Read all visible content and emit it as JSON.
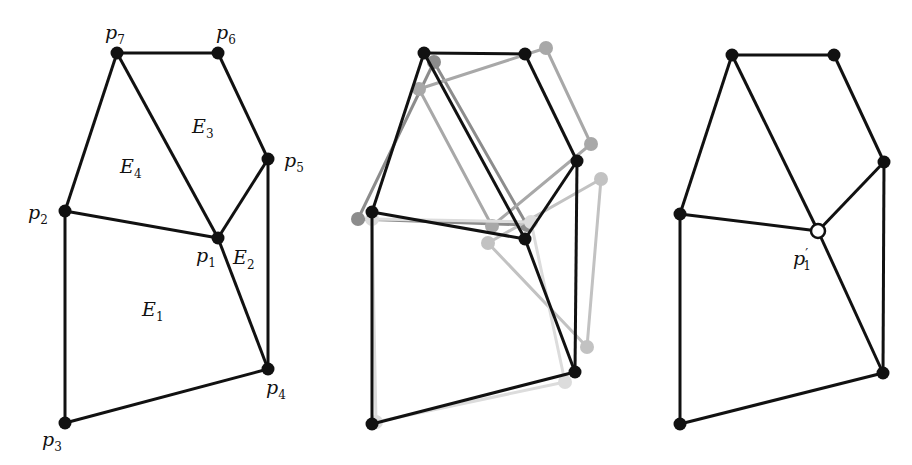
{
  "figure": {
    "panels": [
      {
        "id": "left",
        "title": "",
        "vertices": [
          {
            "name": "p1",
            "x": 218,
            "y": 238,
            "lx": 196,
            "ly": 262,
            "label": "p",
            "sub": "1"
          },
          {
            "name": "p2",
            "x": 65,
            "y": 211,
            "lx": 28,
            "ly": 219,
            "label": "p",
            "sub": "2"
          },
          {
            "name": "p3",
            "x": 65,
            "y": 423,
            "lx": 42,
            "ly": 446,
            "label": "p",
            "sub": "3"
          },
          {
            "name": "p4",
            "x": 268,
            "y": 369,
            "lx": 266,
            "ly": 394,
            "label": "p",
            "sub": "4"
          },
          {
            "name": "p5",
            "x": 268,
            "y": 159,
            "lx": 284,
            "ly": 167,
            "label": "p",
            "sub": "5"
          },
          {
            "name": "p6",
            "x": 218,
            "y": 53,
            "lx": 216,
            "ly": 39,
            "label": "p",
            "sub": "6"
          },
          {
            "name": "p7",
            "x": 117,
            "y": 53,
            "lx": 105,
            "ly": 39,
            "label": "p",
            "sub": "7"
          }
        ],
        "edges": [
          [
            "p7",
            "p6"
          ],
          [
            "p6",
            "p5"
          ],
          [
            "p5",
            "p4"
          ],
          [
            "p4",
            "p3"
          ],
          [
            "p3",
            "p2"
          ],
          [
            "p2",
            "p7"
          ],
          [
            "p7",
            "p1"
          ],
          [
            "p2",
            "p1"
          ],
          [
            "p5",
            "p1"
          ],
          [
            "p1",
            "p4"
          ]
        ],
        "faces": [
          {
            "label": "E",
            "sub": "1",
            "x": 142,
            "y": 316
          },
          {
            "label": "E",
            "sub": "2",
            "x": 233,
            "y": 264
          },
          {
            "label": "E",
            "sub": "3",
            "x": 192,
            "y": 133
          },
          {
            "label": "E",
            "sub": "4",
            "x": 120,
            "y": 173
          }
        ]
      },
      {
        "id": "middle",
        "black": {
          "vertices": [
            [
              424,
              53
            ],
            [
              525,
              54
            ],
            [
              577,
              161
            ],
            [
              575,
              372
            ],
            [
              372,
              424
            ],
            [
              372,
              212
            ],
            [
              525,
              239
            ]
          ],
          "edges": [
            [
              0,
              1
            ],
            [
              1,
              2
            ],
            [
              2,
              3
            ],
            [
              3,
              4
            ],
            [
              4,
              5
            ],
            [
              5,
              0
            ],
            [
              0,
              6
            ],
            [
              5,
              6
            ],
            [
              2,
              6
            ],
            [
              6,
              3
            ]
          ]
        },
        "overlays": [
          {
            "face": "E4",
            "color": "#8c8c8c",
            "points": [
              [
                434,
                62
              ],
              [
                358,
                219
              ],
              [
                527,
                225
              ]
            ]
          },
          {
            "face": "E3",
            "color": "#a8a8a8",
            "points": [
              [
                419,
                89
              ],
              [
                546,
                48
              ],
              [
                591,
                144
              ],
              [
                492,
                226
              ]
            ]
          },
          {
            "face": "E2",
            "color": "#c2c2c2",
            "points": [
              [
                488,
                243
              ],
              [
                601,
                179
              ],
              [
                587,
                347
              ]
            ]
          },
          {
            "face": "E1",
            "color": "#dcdcdc",
            "points": [
              [
                372,
                219
              ],
              [
                531,
                222
              ],
              [
                565,
                382
              ],
              [
                376,
                422
              ]
            ]
          }
        ]
      },
      {
        "id": "right",
        "vertices": [
          {
            "name": "p7",
            "x": 732,
            "y": 55
          },
          {
            "name": "p6",
            "x": 834,
            "y": 55
          },
          {
            "name": "p5",
            "x": 884,
            "y": 162
          },
          {
            "name": "p2",
            "x": 680,
            "y": 214
          },
          {
            "name": "p1_prime",
            "x": 818,
            "y": 231,
            "open": true
          },
          {
            "name": "p4",
            "x": 883,
            "y": 373
          },
          {
            "name": "p3",
            "x": 680,
            "y": 424
          }
        ],
        "edges": [
          [
            "p7",
            "p6"
          ],
          [
            "p6",
            "p5"
          ],
          [
            "p5",
            "p4"
          ],
          [
            "p4",
            "p3"
          ],
          [
            "p3",
            "p2"
          ],
          [
            "p2",
            "p7"
          ],
          [
            "p7",
            "p1_prime"
          ],
          [
            "p2",
            "p1_prime"
          ],
          [
            "p5",
            "p1_prime"
          ],
          [
            "p1_prime",
            "p4"
          ]
        ],
        "label": {
          "text": "p",
          "prime": "′",
          "sub": "1",
          "x": 793,
          "y": 265
        }
      }
    ],
    "colors": {
      "stroke": "#111111",
      "vertex": "#111111",
      "open_vertex_fill": "#ffffff"
    }
  }
}
